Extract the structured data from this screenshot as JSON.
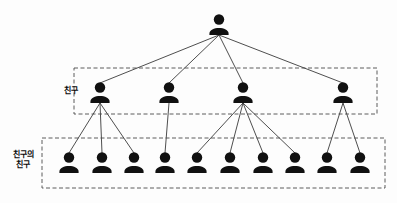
{
  "figure": {
    "caption": "",
    "node_color": "#111111",
    "edge_color": "#3a3a3a",
    "box_border_color": "#4a4a4a",
    "background": "#fdfdfd",
    "width": 397,
    "height": 203
  },
  "labels": {
    "tier1": "친구",
    "tier2": "친구의\n친구"
  },
  "boxes": [
    {
      "name": "friend-box",
      "x": 74,
      "y": 68,
      "w": 303,
      "h": 46
    },
    {
      "name": "friend-of-friend-box",
      "x": 42,
      "y": 138,
      "w": 343,
      "h": 50
    }
  ],
  "graph": {
    "type": "tree",
    "levels": 3,
    "root": {
      "id": "me",
      "x": 219,
      "y": 22
    },
    "friends": [
      {
        "id": "f1",
        "x": 100,
        "y": 90
      },
      {
        "id": "f2",
        "x": 169,
        "y": 90
      },
      {
        "id": "f3",
        "x": 243,
        "y": 90
      },
      {
        "id": "f4",
        "x": 343,
        "y": 90
      }
    ],
    "friends_of_friends": [
      {
        "id": "ff1",
        "x": 69,
        "y": 160,
        "parent": "f1"
      },
      {
        "id": "ff2",
        "x": 102,
        "y": 160,
        "parent": "f1"
      },
      {
        "id": "ff3",
        "x": 134,
        "y": 160,
        "parent": "f1"
      },
      {
        "id": "ff4",
        "x": 165,
        "y": 160,
        "parent": "f2"
      },
      {
        "id": "ff5",
        "x": 197,
        "y": 160,
        "parent": "f3"
      },
      {
        "id": "ff6",
        "x": 230,
        "y": 160,
        "parent": "f3"
      },
      {
        "id": "ff7",
        "x": 263,
        "y": 160,
        "parent": "f3"
      },
      {
        "id": "ff8",
        "x": 295,
        "y": 160,
        "parent": "f3"
      },
      {
        "id": "ff9",
        "x": 327,
        "y": 160,
        "parent": "f4"
      },
      {
        "id": "ff10",
        "x": 360,
        "y": 160,
        "parent": "f4"
      }
    ],
    "edges": [
      {
        "from": "me",
        "to": "f1"
      },
      {
        "from": "me",
        "to": "f2"
      },
      {
        "from": "me",
        "to": "f3"
      },
      {
        "from": "me",
        "to": "f4"
      },
      {
        "from": "f1",
        "to": "ff1"
      },
      {
        "from": "f1",
        "to": "ff2"
      },
      {
        "from": "f1",
        "to": "ff3"
      },
      {
        "from": "f2",
        "to": "ff4"
      },
      {
        "from": "f3",
        "to": "ff5"
      },
      {
        "from": "f3",
        "to": "ff6"
      },
      {
        "from": "f3",
        "to": "ff7"
      },
      {
        "from": "f3",
        "to": "ff8"
      },
      {
        "from": "f4",
        "to": "ff9"
      },
      {
        "from": "f4",
        "to": "ff10"
      }
    ],
    "counts": {
      "root": 1,
      "friends": 4,
      "friends_of_friends": 10
    }
  }
}
